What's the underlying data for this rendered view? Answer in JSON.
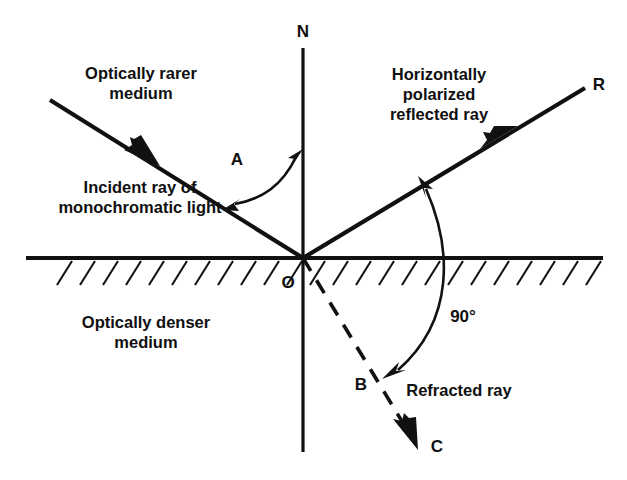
{
  "figure": {
    "background_color": "#ffffff",
    "line_color": "#111111"
  },
  "labels": {
    "normal": "N",
    "reflected_end": "R",
    "origin": "O",
    "refraction_point": "B",
    "refracted_end": "C",
    "angle_incidence": "A",
    "angle_between_rays": "90°",
    "rarer_medium_line1": "Optically rarer",
    "rarer_medium_line2": "medium",
    "incident_ray_line1": "Incident ray of",
    "incident_ray_line2": "monochromatic light",
    "reflected_ray_line1": "Horizontally",
    "reflected_ray_line2": "polarized",
    "reflected_ray_line3": "reflected ray",
    "denser_medium_line1": "Optically denser",
    "denser_medium_line2": "medium",
    "refracted_ray": "Refracted ray"
  },
  "geometry": {
    "origin_x": 303,
    "origin_y": 258,
    "normal_top_y": 48,
    "normal_bottom_y": 452,
    "interface_left_x": 26,
    "interface_right_x": 603,
    "incident_start_x": 50,
    "incident_start_y": 100,
    "reflected_end_x": 585,
    "reflected_end_y": 88,
    "refracted_b_x": 372,
    "refracted_b_y": 375,
    "refracted_end_x": 415,
    "refracted_end_y": 444
  }
}
